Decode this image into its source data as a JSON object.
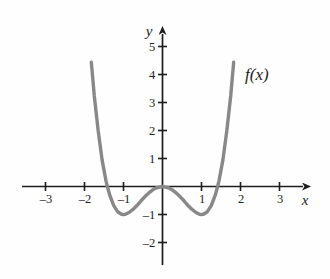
{
  "figure": {
    "kind": "cartesian-graph",
    "background_color": "#fefefe",
    "axis_color": "#1d1d1d",
    "curve_color": "#888888",
    "curve_width_px": 3.4
  },
  "axes": {
    "x_axis_label": "x",
    "y_axis_label": "y",
    "x_ticks": [
      {
        "value": -3,
        "label": "–3"
      },
      {
        "value": -2,
        "label": "–2"
      },
      {
        "value": -1,
        "label": "–1"
      },
      {
        "value": 1,
        "label": "1"
      },
      {
        "value": 2,
        "label": "2"
      },
      {
        "value": 3,
        "label": "3"
      }
    ],
    "y_ticks": [
      {
        "value": 5,
        "label": "5"
      },
      {
        "value": 4,
        "label": "4"
      },
      {
        "value": 3,
        "label": "3"
      },
      {
        "value": 2,
        "label": "2"
      },
      {
        "value": 1,
        "label": "1"
      },
      {
        "value": -1,
        "label": "–1"
      },
      {
        "value": -2,
        "label": "–2"
      }
    ]
  },
  "annotations": {
    "curve_label": "f(x)"
  },
  "chart_data": {
    "type": "line",
    "title": "",
    "subtitle": "",
    "xlabel": "x",
    "ylabel": "y",
    "xlim": [
      -3.6,
      4.0
    ],
    "ylim": [
      -2.8,
      5.6
    ],
    "xticks": [
      -3,
      -2,
      -1,
      1,
      2,
      3
    ],
    "yticks": [
      5,
      4,
      3,
      2,
      1,
      -1,
      -2
    ],
    "grid": false,
    "legend": null,
    "annotations": [
      {
        "text": "f(x)",
        "x": 2.3,
        "y": 4.1
      }
    ],
    "series": [
      {
        "name": "f(x)",
        "color": "#888888",
        "equation": "x^4 - 2x^2",
        "x_domain": [
          -1.825,
          1.825
        ],
        "x": [
          -1.825,
          -1.75,
          -1.65,
          -1.55,
          -1.45,
          -1.414,
          -1.35,
          -1.25,
          -1.15,
          -1.05,
          -1.0,
          -0.95,
          -0.85,
          -0.75,
          -0.65,
          -0.55,
          -0.45,
          -0.35,
          -0.25,
          -0.15,
          0.0,
          0.15,
          0.25,
          0.35,
          0.45,
          0.55,
          0.65,
          0.75,
          0.85,
          0.95,
          1.0,
          1.05,
          1.15,
          1.25,
          1.35,
          1.414,
          1.45,
          1.55,
          1.65,
          1.75,
          1.825
        ],
        "y": [
          4.44,
          3.25,
          2.0,
          0.96,
          0.21,
          0.0,
          -0.32,
          -0.68,
          -0.9,
          -0.99,
          -1.0,
          -0.99,
          -0.92,
          -0.81,
          -0.67,
          -0.51,
          -0.36,
          -0.23,
          -0.12,
          -0.044,
          0.0,
          -0.044,
          -0.12,
          -0.23,
          -0.36,
          -0.51,
          -0.67,
          -0.81,
          -0.92,
          -0.99,
          -1.0,
          -0.99,
          -0.9,
          -0.68,
          -0.32,
          0.0,
          0.21,
          0.96,
          2.0,
          3.25,
          4.44
        ],
        "minima": [
          {
            "x": -1,
            "y": -1
          },
          {
            "x": 1,
            "y": -1
          }
        ],
        "local_maxima": [
          {
            "x": 0,
            "y": 0
          }
        ],
        "x_intercepts": [
          -1.414,
          0,
          1.414
        ]
      }
    ]
  }
}
